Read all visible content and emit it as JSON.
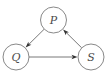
{
  "diagram": {
    "type": "directed-graph",
    "nodes": [
      {
        "id": "P",
        "label": "P"
      },
      {
        "id": "Q",
        "label": "Q"
      },
      {
        "id": "S",
        "label": "S"
      }
    ],
    "edges": [
      {
        "from": "P",
        "to": "Q"
      },
      {
        "from": "Q",
        "to": "S"
      },
      {
        "from": "S",
        "to": "P"
      }
    ],
    "colors": {
      "node_stroke": "#7a7a7a",
      "edge": "#555555",
      "label": "#4a4a4a"
    }
  }
}
